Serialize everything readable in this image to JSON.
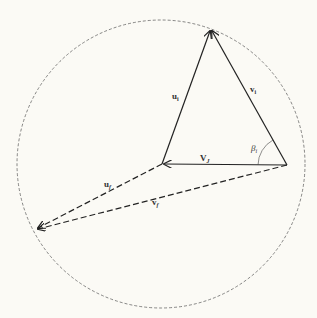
{
  "diagram": {
    "background": "#fbfaf5",
    "stroke_color": "#222222",
    "circle": {
      "cx": 161,
      "cy": 164,
      "r": 144,
      "style": "dashed"
    },
    "points": {
      "top": [
        211,
        29
      ],
      "center": [
        162,
        164
      ],
      "right": [
        287,
        165
      ],
      "bottom_left": [
        36,
        229
      ]
    },
    "labels": {
      "u_i": {
        "base": "u",
        "sub": "i"
      },
      "v_i": {
        "base": "v",
        "sub": "i"
      },
      "beta_i": {
        "base": "β",
        "sub": "i"
      },
      "V_J": {
        "base": "V",
        "sub": "J"
      },
      "u_f": {
        "base": "u",
        "sub": "f"
      },
      "v_f": {
        "base": "v",
        "sub": "f"
      }
    },
    "vectors": [
      {
        "name": "u_i",
        "from": "center",
        "to": "top",
        "style": "solid"
      },
      {
        "name": "v_i",
        "from": "right",
        "to": "top",
        "style": "solid"
      },
      {
        "name": "V_J",
        "from": "right",
        "to": "center",
        "style": "solid"
      },
      {
        "name": "u_f",
        "from": "center",
        "to": "bottom_left",
        "style": "dashed"
      },
      {
        "name": "v_f",
        "from": "right",
        "to": "bottom_left",
        "style": "dashed"
      }
    ],
    "angle_arc": {
      "label": "beta_i",
      "at": "right",
      "between": [
        "V_J",
        "v_i"
      ]
    }
  }
}
